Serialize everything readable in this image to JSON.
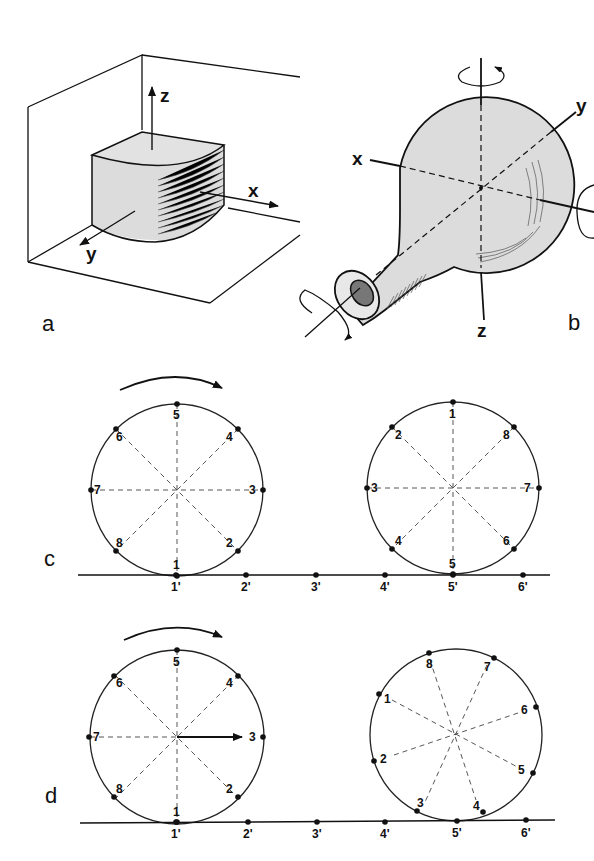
{
  "figure": {
    "panels": {
      "a": {
        "letter": "a",
        "axes": {
          "z": "z",
          "x": "x",
          "y": "y"
        }
      },
      "b": {
        "letter": "b",
        "axes": {
          "x": "x",
          "y": "y",
          "z": "z"
        }
      },
      "c": {
        "letter": "c",
        "left_wheel_points": [
          "1",
          "2",
          "3",
          "4",
          "5",
          "6",
          "7",
          "8"
        ],
        "right_wheel_points": [
          "1",
          "2",
          "3",
          "4",
          "5",
          "6",
          "7",
          "8"
        ],
        "baseline_marks": [
          "1'",
          "2'",
          "3'",
          "4'",
          "5'",
          "6'"
        ]
      },
      "d": {
        "letter": "d",
        "left_wheel_points": [
          "1",
          "2",
          "3",
          "4",
          "5",
          "6",
          "7",
          "8"
        ],
        "right_wheel_points": [
          "1",
          "2",
          "3",
          "4",
          "5",
          "6",
          "7",
          "8"
        ],
        "baseline_marks": [
          "1'",
          "2'",
          "3'",
          "4'",
          "5'",
          "6'"
        ]
      }
    },
    "colors": {
      "ink": "#111111",
      "fill_gray": "#dcdcdc",
      "background": "#ffffff"
    }
  }
}
